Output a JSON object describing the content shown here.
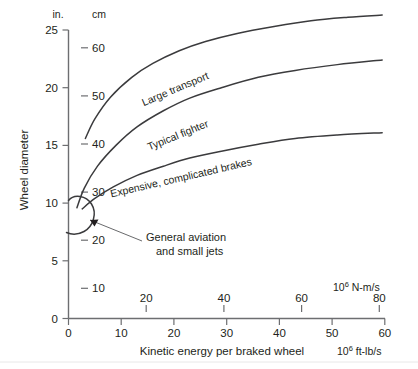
{
  "chart_data": {
    "type": "line",
    "title": "",
    "xlabel": "Kinetic energy per braked wheel",
    "ylabel": "Wheel diameter",
    "x_axis_primary": {
      "unit_label": "10⁶ ft-lb/s",
      "unit_base": "10",
      "unit_exp": "6",
      "unit_rest": " ft-lb/s",
      "ticks": [
        0,
        10,
        20,
        30,
        40,
        50,
        60
      ],
      "range": [
        0,
        60
      ]
    },
    "x_axis_secondary": {
      "unit_label": "10⁶ N-m/s",
      "unit_base": "10",
      "unit_exp": "6",
      "unit_rest": " N-m/s",
      "ticks": [
        20,
        40,
        60,
        80
      ],
      "range": [
        0,
        81.35
      ]
    },
    "y_axis_primary": {
      "unit_label": "in.",
      "ticks": [
        0,
        5,
        10,
        15,
        20,
        25
      ],
      "range": [
        0,
        25
      ]
    },
    "y_axis_secondary": {
      "unit_label": "cm",
      "ticks": [
        10,
        20,
        30,
        40,
        50,
        60
      ],
      "range": [
        0,
        63.5
      ]
    },
    "grid": false,
    "legend_position": "inline-curve-labels",
    "series": [
      {
        "name": "Large transport",
        "label": "Large transport",
        "label_x": 20.5,
        "label_y": 19.6,
        "label_rotation": -23,
        "points": [
          [
            3.2,
            15.6
          ],
          [
            5.0,
            17.3
          ],
          [
            8.0,
            19.2
          ],
          [
            12.0,
            20.9
          ],
          [
            16.0,
            22.1
          ],
          [
            21.0,
            23.2
          ],
          [
            26.0,
            24.0
          ],
          [
            32.0,
            24.7
          ],
          [
            39.0,
            25.3
          ],
          [
            46.0,
            25.8
          ],
          [
            53.0,
            26.1
          ],
          [
            59.5,
            26.3
          ]
        ]
      },
      {
        "name": "Typical fighter",
        "label": "Typical fighter",
        "label_x": 21.0,
        "label_y": 15.6,
        "label_rotation": -22,
        "points": [
          [
            1.6,
            9.6
          ],
          [
            3.0,
            11.3
          ],
          [
            5.5,
            13.2
          ],
          [
            9.0,
            15.0
          ],
          [
            13.0,
            16.6
          ],
          [
            18.0,
            18.0
          ],
          [
            23.0,
            19.1
          ],
          [
            29.0,
            20.0
          ],
          [
            36.0,
            20.9
          ],
          [
            43.0,
            21.5
          ],
          [
            51.0,
            22.0
          ],
          [
            59.5,
            22.4
          ]
        ]
      },
      {
        "name": "Expensive, complicated brakes",
        "label": "Expensive, complicated brakes",
        "label_x": 21.5,
        "label_y": 11.9,
        "label_rotation": -13,
        "points": [
          [
            2.6,
            9.5
          ],
          [
            5.0,
            10.4
          ],
          [
            8.5,
            11.4
          ],
          [
            13.0,
            12.4
          ],
          [
            18.0,
            13.2
          ],
          [
            23.0,
            13.9
          ],
          [
            29.0,
            14.5
          ],
          [
            36.0,
            15.1
          ],
          [
            43.0,
            15.6
          ],
          [
            51.0,
            15.9
          ],
          [
            59.5,
            16.1
          ]
        ]
      }
    ],
    "annotations": [
      {
        "name": "general-aviation-callout",
        "text_line1": "General aviation",
        "text_line2": "and small jets",
        "text_x": 19.5,
        "text_y": 6.5,
        "marker_shape": "ellipse",
        "marker_note": "closed loop cluster near origin spanning about 0 to 3.5 (10⁶ ft-lb/s) and 6.8 to 10 in."
      }
    ]
  }
}
